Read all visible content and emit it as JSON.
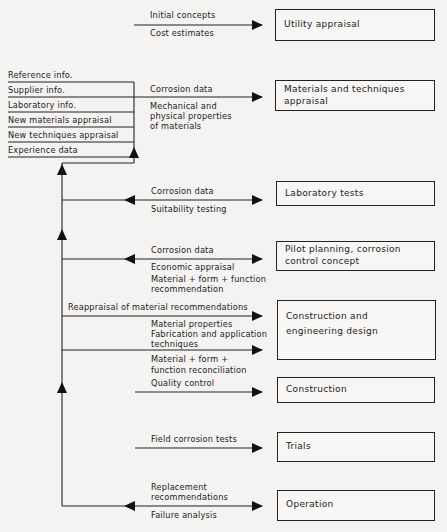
{
  "diagram": {
    "type": "flowchart",
    "stages": [
      {
        "id": "utility",
        "label": "Utility appraisal",
        "inputs": [
          "Initial concepts",
          "Cost estimates"
        ]
      },
      {
        "id": "materials",
        "label_lines": [
          "Materials and techniques",
          "appraisal"
        ],
        "inputs": [
          "Corrosion data",
          "Mechanical and",
          "physical properties",
          "of materials"
        ]
      },
      {
        "id": "laboratory",
        "label": "Laboratory tests",
        "inputs": [
          "Corrosion data",
          "Suitability testing"
        ]
      },
      {
        "id": "pilot",
        "label_lines": [
          "Pilot planning, corrosion",
          "control concept"
        ],
        "inputs": [
          "Corrosion data",
          "Economic appraisal",
          "Material + form + function",
          "recommendation"
        ]
      },
      {
        "id": "design",
        "label_lines": [
          "Construction and",
          "engineering design"
        ],
        "inputs": [
          "Reappraisal of material recommendations",
          "Material properties",
          "Fabrication and application",
          "techniques",
          "Material + form +",
          "function reconciliation"
        ]
      },
      {
        "id": "construction",
        "label": "Construction",
        "inputs": [
          "Quality control"
        ]
      },
      {
        "id": "trials",
        "label": "Trials",
        "inputs": [
          "Field corrosion tests"
        ]
      },
      {
        "id": "operation",
        "label": "Operation",
        "inputs": [
          "Replacement",
          "recommendations",
          "Failure analysis"
        ]
      }
    ],
    "info_sources": [
      "Reference info.",
      "Supplier info.",
      "Laboratory info.",
      "New materials appraisal",
      "New techniques appraisal",
      "Experience data"
    ]
  }
}
